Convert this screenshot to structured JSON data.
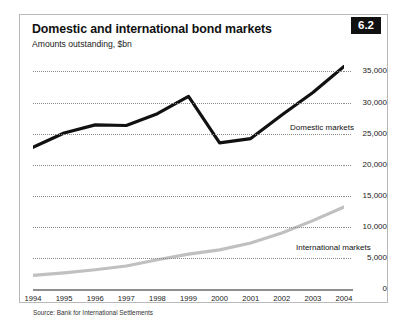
{
  "figure": {
    "number_badge": "6.2",
    "title": "Domestic and international bond markets",
    "subtitle": "Amounts outstanding, $bn",
    "source": "Source: Bank for International Settlements"
  },
  "colors": {
    "domestic_line": "#111111",
    "international_line": "#c0c0c0",
    "gridline": "#8b8b8b",
    "badge_background": "#111111",
    "badge_text": "#ffffff",
    "border": "#b9b9b9"
  },
  "chart_data": {
    "type": "line",
    "title": "Domestic and international bond markets",
    "subtitle": "Amounts outstanding, $bn",
    "xlabel": "",
    "ylabel": "Amounts outstanding, $bn",
    "ylim": [
      0,
      37000
    ],
    "yticks": [
      0,
      5000,
      10000,
      15000,
      20000,
      25000,
      30000,
      35000
    ],
    "ytick_labels": [
      "0",
      "5,000",
      "10,000",
      "15,000",
      "20,000",
      "25,000",
      "30,000",
      "35,000"
    ],
    "y_axis_position": "right",
    "grid": true,
    "grid_style": "dotted",
    "legend_position": "inline-annotation",
    "categories": [
      1994,
      1995,
      1996,
      1997,
      1998,
      1999,
      2000,
      2001,
      2002,
      2003,
      2004
    ],
    "xtick_labels": [
      "1994",
      "1995",
      "1996",
      "1997",
      "1998",
      "1999",
      "2000",
      "2001",
      "2002",
      "2003",
      "2004"
    ],
    "series": [
      {
        "name": "Domestic markets",
        "color": "#111111",
        "values": [
          22800,
          25100,
          26400,
          26300,
          28200,
          31000,
          23500,
          24200,
          28000,
          31600,
          35800
        ]
      },
      {
        "name": "International markets",
        "color": "#c0c0c0",
        "values": [
          2200,
          2600,
          3100,
          3700,
          4700,
          5600,
          6300,
          7400,
          9000,
          11000,
          13200
        ]
      }
    ],
    "annotations": [
      {
        "text": "Domestic markets",
        "x": 2001.3,
        "y": 27000
      },
      {
        "text": "International markets",
        "x": 2001.6,
        "y": 7000
      }
    ]
  }
}
